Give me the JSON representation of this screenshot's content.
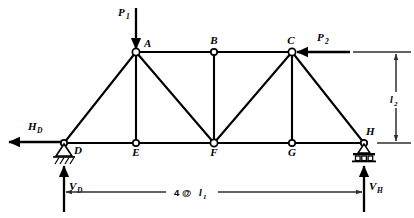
{
  "figure": {
    "stroke_color": "#000000",
    "dim_color": "#3a3a3a",
    "background": "#ffffff"
  },
  "nodes": [
    {
      "id": "A",
      "label": "A",
      "x": 136,
      "y": 52,
      "chord": "top",
      "label_dx": 8,
      "label_dy": -5
    },
    {
      "id": "B",
      "label": "B",
      "x": 214,
      "y": 52,
      "chord": "top",
      "label_dx": 0,
      "label_dy": -8
    },
    {
      "id": "C",
      "label": "C",
      "x": 292,
      "y": 52,
      "chord": "top",
      "label_dx": -1,
      "label_dy": -8
    },
    {
      "id": "D",
      "label": "D",
      "x": 64,
      "y": 143,
      "chord": "bottom",
      "label_dx": 10,
      "label_dy": 11
    },
    {
      "id": "E",
      "label": "E",
      "x": 136,
      "y": 143,
      "chord": "bottom",
      "label_dx": 0,
      "label_dy": 13
    },
    {
      "id": "F",
      "label": "F",
      "x": 214,
      "y": 143,
      "chord": "bottom",
      "label_dx": 0,
      "label_dy": 13
    },
    {
      "id": "G",
      "label": "G",
      "x": 292,
      "y": 143,
      "chord": "bottom",
      "label_dx": 0,
      "label_dy": 13
    },
    {
      "id": "H",
      "label": "H",
      "x": 364,
      "y": 143,
      "chord": "bottom",
      "label_dx": 2,
      "label_dy": -8
    }
  ],
  "members": [
    {
      "from": "A",
      "to": "B",
      "type": "top-chord"
    },
    {
      "from": "B",
      "to": "C",
      "type": "top-chord"
    },
    {
      "from": "D",
      "to": "E",
      "type": "bottom-chord"
    },
    {
      "from": "E",
      "to": "F",
      "type": "bottom-chord"
    },
    {
      "from": "F",
      "to": "G",
      "type": "bottom-chord"
    },
    {
      "from": "G",
      "to": "H",
      "type": "bottom-chord"
    },
    {
      "from": "A",
      "to": "E",
      "type": "vertical"
    },
    {
      "from": "B",
      "to": "F",
      "type": "vertical"
    },
    {
      "from": "C",
      "to": "G",
      "type": "vertical"
    },
    {
      "from": "D",
      "to": "A",
      "type": "diagonal"
    },
    {
      "from": "A",
      "to": "F",
      "type": "diagonal"
    },
    {
      "from": "F",
      "to": "C",
      "type": "diagonal"
    },
    {
      "from": "C",
      "to": "H",
      "type": "diagonal"
    }
  ],
  "loads": [
    {
      "name": "P1",
      "symbol": "P",
      "subscript": "1",
      "at_node": "A",
      "direction": "down",
      "label_x": 124,
      "label_y": 14,
      "arrow": {
        "x1": 136,
        "y1": 8,
        "x2": 136,
        "y2": 50
      }
    },
    {
      "name": "P2",
      "symbol": "P",
      "subscript": "2",
      "at_node": "C",
      "direction": "left",
      "label_x": 318,
      "label_y": 40,
      "arrow": {
        "x1": 348,
        "y1": 52,
        "x2": 296,
        "y2": 52
      }
    }
  ],
  "supports": [
    {
      "name": "pin-support",
      "type": "pin",
      "at_node": "D",
      "x": 64,
      "y": 143,
      "reactions": [
        "HD",
        "VD"
      ]
    },
    {
      "name": "roller-support",
      "type": "roller",
      "at_node": "H",
      "x": 364,
      "y": 143,
      "reactions": [
        "VH"
      ]
    }
  ],
  "reactions": [
    {
      "name": "HD",
      "symbol": "H",
      "subscript": "D",
      "at_node": "D",
      "direction": "left",
      "label_x": 30,
      "label_y": 127,
      "arrow": {
        "x1": 60,
        "y1": 142,
        "x2": 8,
        "y2": 142
      }
    },
    {
      "name": "VD",
      "symbol": "V",
      "subscript": "D",
      "at_node": "D",
      "direction": "up",
      "label_x": 70,
      "label_y": 188,
      "arrow": {
        "x1": 64,
        "y1": 210,
        "x2": 64,
        "y2": 163
      }
    },
    {
      "name": "VH",
      "symbol": "V",
      "subscript": "H",
      "at_node": "H",
      "direction": "up",
      "label_x": 370,
      "label_y": 188,
      "arrow": {
        "x1": 364,
        "y1": 210,
        "x2": 364,
        "y2": 163
      }
    }
  ],
  "dimensions": [
    {
      "name": "span-dimension",
      "orientation": "horizontal",
      "text_prefix": "4 @ ",
      "text_symbol": "l",
      "text_subscript": "1",
      "full_text": "4 @ l1",
      "label_x": 189,
      "label_y": 196,
      "line_y": 192,
      "x_start": 64,
      "x_end": 364,
      "gap_left": 166,
      "gap_right": 218
    },
    {
      "name": "height-dimension",
      "orientation": "vertical",
      "text_symbol": "l",
      "text_subscript": "2",
      "full_text": "l2",
      "label_x": 391,
      "label_y": 101,
      "line_x": 396,
      "y_start": 52,
      "y_end": 143,
      "ext_top": {
        "x1": 352,
        "y1": 52,
        "x2": 410,
        "y2": 52
      },
      "ext_bottom": {
        "x1": 376,
        "y1": 143,
        "x2": 410,
        "y2": 143
      }
    }
  ]
}
